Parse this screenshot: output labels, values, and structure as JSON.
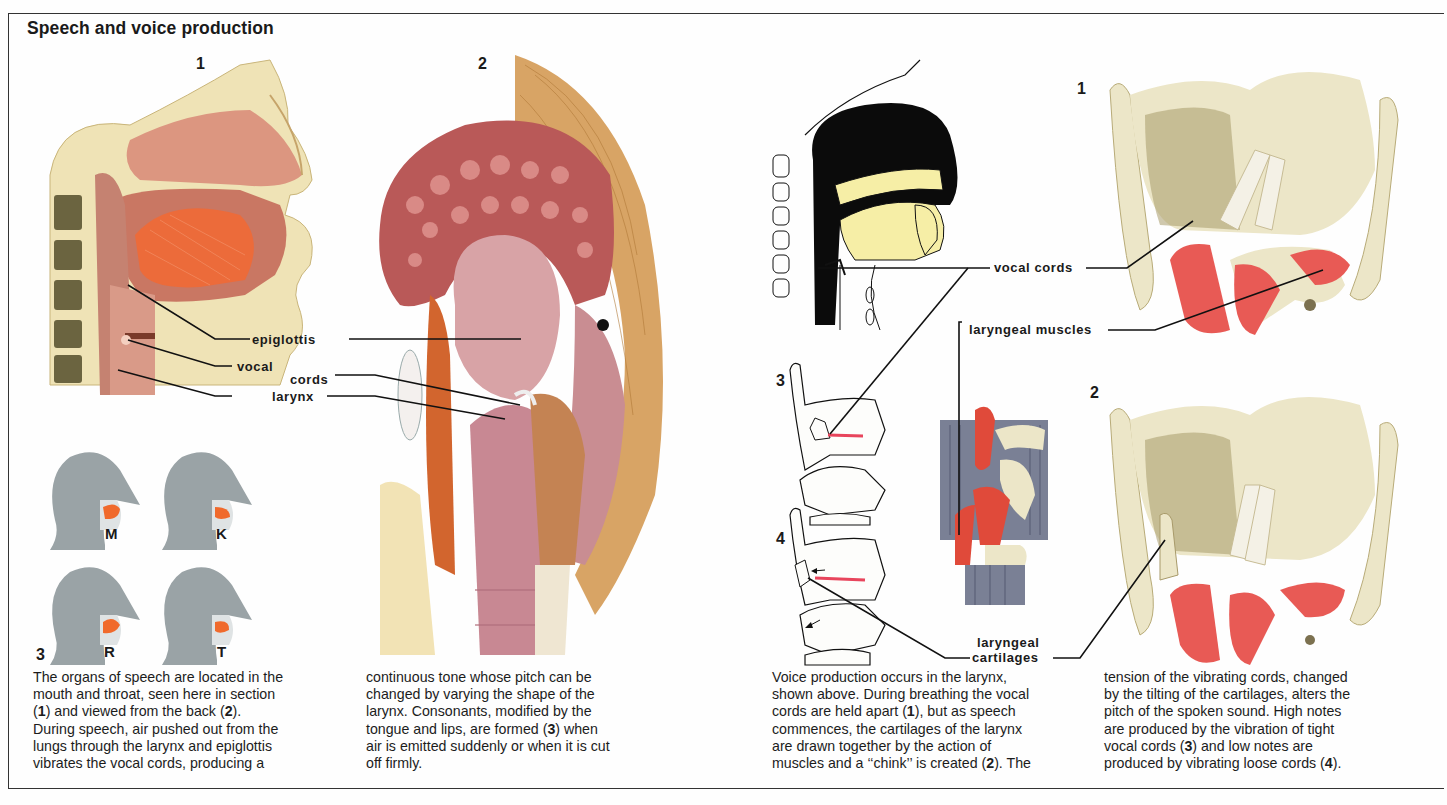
{
  "page": {
    "title": "Speech and voice production"
  },
  "left_section": {
    "figures": [
      {
        "number": "1",
        "description": "Sagittal section of head showing organs of speech"
      },
      {
        "number": "2",
        "description": "Back view of throat and larynx"
      },
      {
        "number": "3",
        "description": "Consonant formation heads"
      }
    ],
    "labels": {
      "epiglottis": "epiglottis",
      "vocal": "vocal",
      "cords": "cords",
      "larynx": "larynx"
    },
    "consonants": [
      "M",
      "K",
      "R",
      "T"
    ],
    "caption_col1": [
      {
        "text": "The organs of speech are located in the"
      },
      {
        "text": "mouth and throat, seen here in section"
      },
      {
        "parts": [
          "(",
          "1",
          ") and viewed from the back (",
          "2",
          ")."
        ]
      },
      {
        "text": "During speech, air pushed out from the"
      },
      {
        "text": "lungs through the larynx and epiglottis"
      },
      {
        "text": "vibrates the vocal cords, producing a"
      }
    ],
    "caption_col2": [
      {
        "text": "continuous tone whose pitch can be"
      },
      {
        "text": "changed by varying the shape of the"
      },
      {
        "text": "larynx. Consonants, modified by the"
      },
      {
        "parts": [
          "tongue and lips, are formed (",
          "3",
          ") when"
        ]
      },
      {
        "text": "air is emitted suddenly or when it is cut"
      },
      {
        "text": "off firmly."
      }
    ]
  },
  "right_section": {
    "figures": [
      {
        "number": "1",
        "description": "Larynx with vocal cords held apart"
      },
      {
        "number": "2",
        "description": "Larynx with cartilages drawn together"
      },
      {
        "number": "3",
        "description": "Tight vocal cords diagram"
      },
      {
        "number": "4",
        "description": "Loose vocal cords diagram"
      }
    ],
    "labels": {
      "vocal_cords": "vocal cords",
      "laryngeal_muscles": "laryngeal muscles",
      "laryngeal": "laryngeal",
      "cartilages": "cartilages"
    },
    "caption_col3": [
      {
        "text": "Voice production occurs in the larynx,"
      },
      {
        "text": "shown above. During breathing the vocal"
      },
      {
        "parts": [
          "cords are held apart (",
          "1",
          "), but as speech"
        ]
      },
      {
        "text": "commences, the cartilages of the larynx"
      },
      {
        "text": "are drawn together by the action of"
      },
      {
        "parts": [
          "muscles and a ‘‘chink’’ is created (",
          "2",
          "). The"
        ]
      }
    ],
    "caption_col4": [
      {
        "text": "tension of the vibrating cords, changed"
      },
      {
        "text": "by the tilting of the cartilages, alters the"
      },
      {
        "text": "pitch of the spoken sound. High notes"
      },
      {
        "text": "are produced by the vibration of tight"
      },
      {
        "parts": [
          "vocal cords (",
          "3",
          ") and low notes are"
        ]
      },
      {
        "parts": [
          "produced by vibrating loose cords (",
          "4",
          ")."
        ]
      }
    ]
  },
  "colors": {
    "flesh": "#d9897a",
    "muscle": "#e8503a",
    "tongue_orange": "#f06a2c",
    "cartilage": "#ece6c8",
    "cartilage_shade": "#a89a6a",
    "head_grey": "#9aa3a6",
    "pale_yellow": "#f7f1a8",
    "red_line": "#e8455c",
    "tan_muscle": "#d19a5a"
  }
}
